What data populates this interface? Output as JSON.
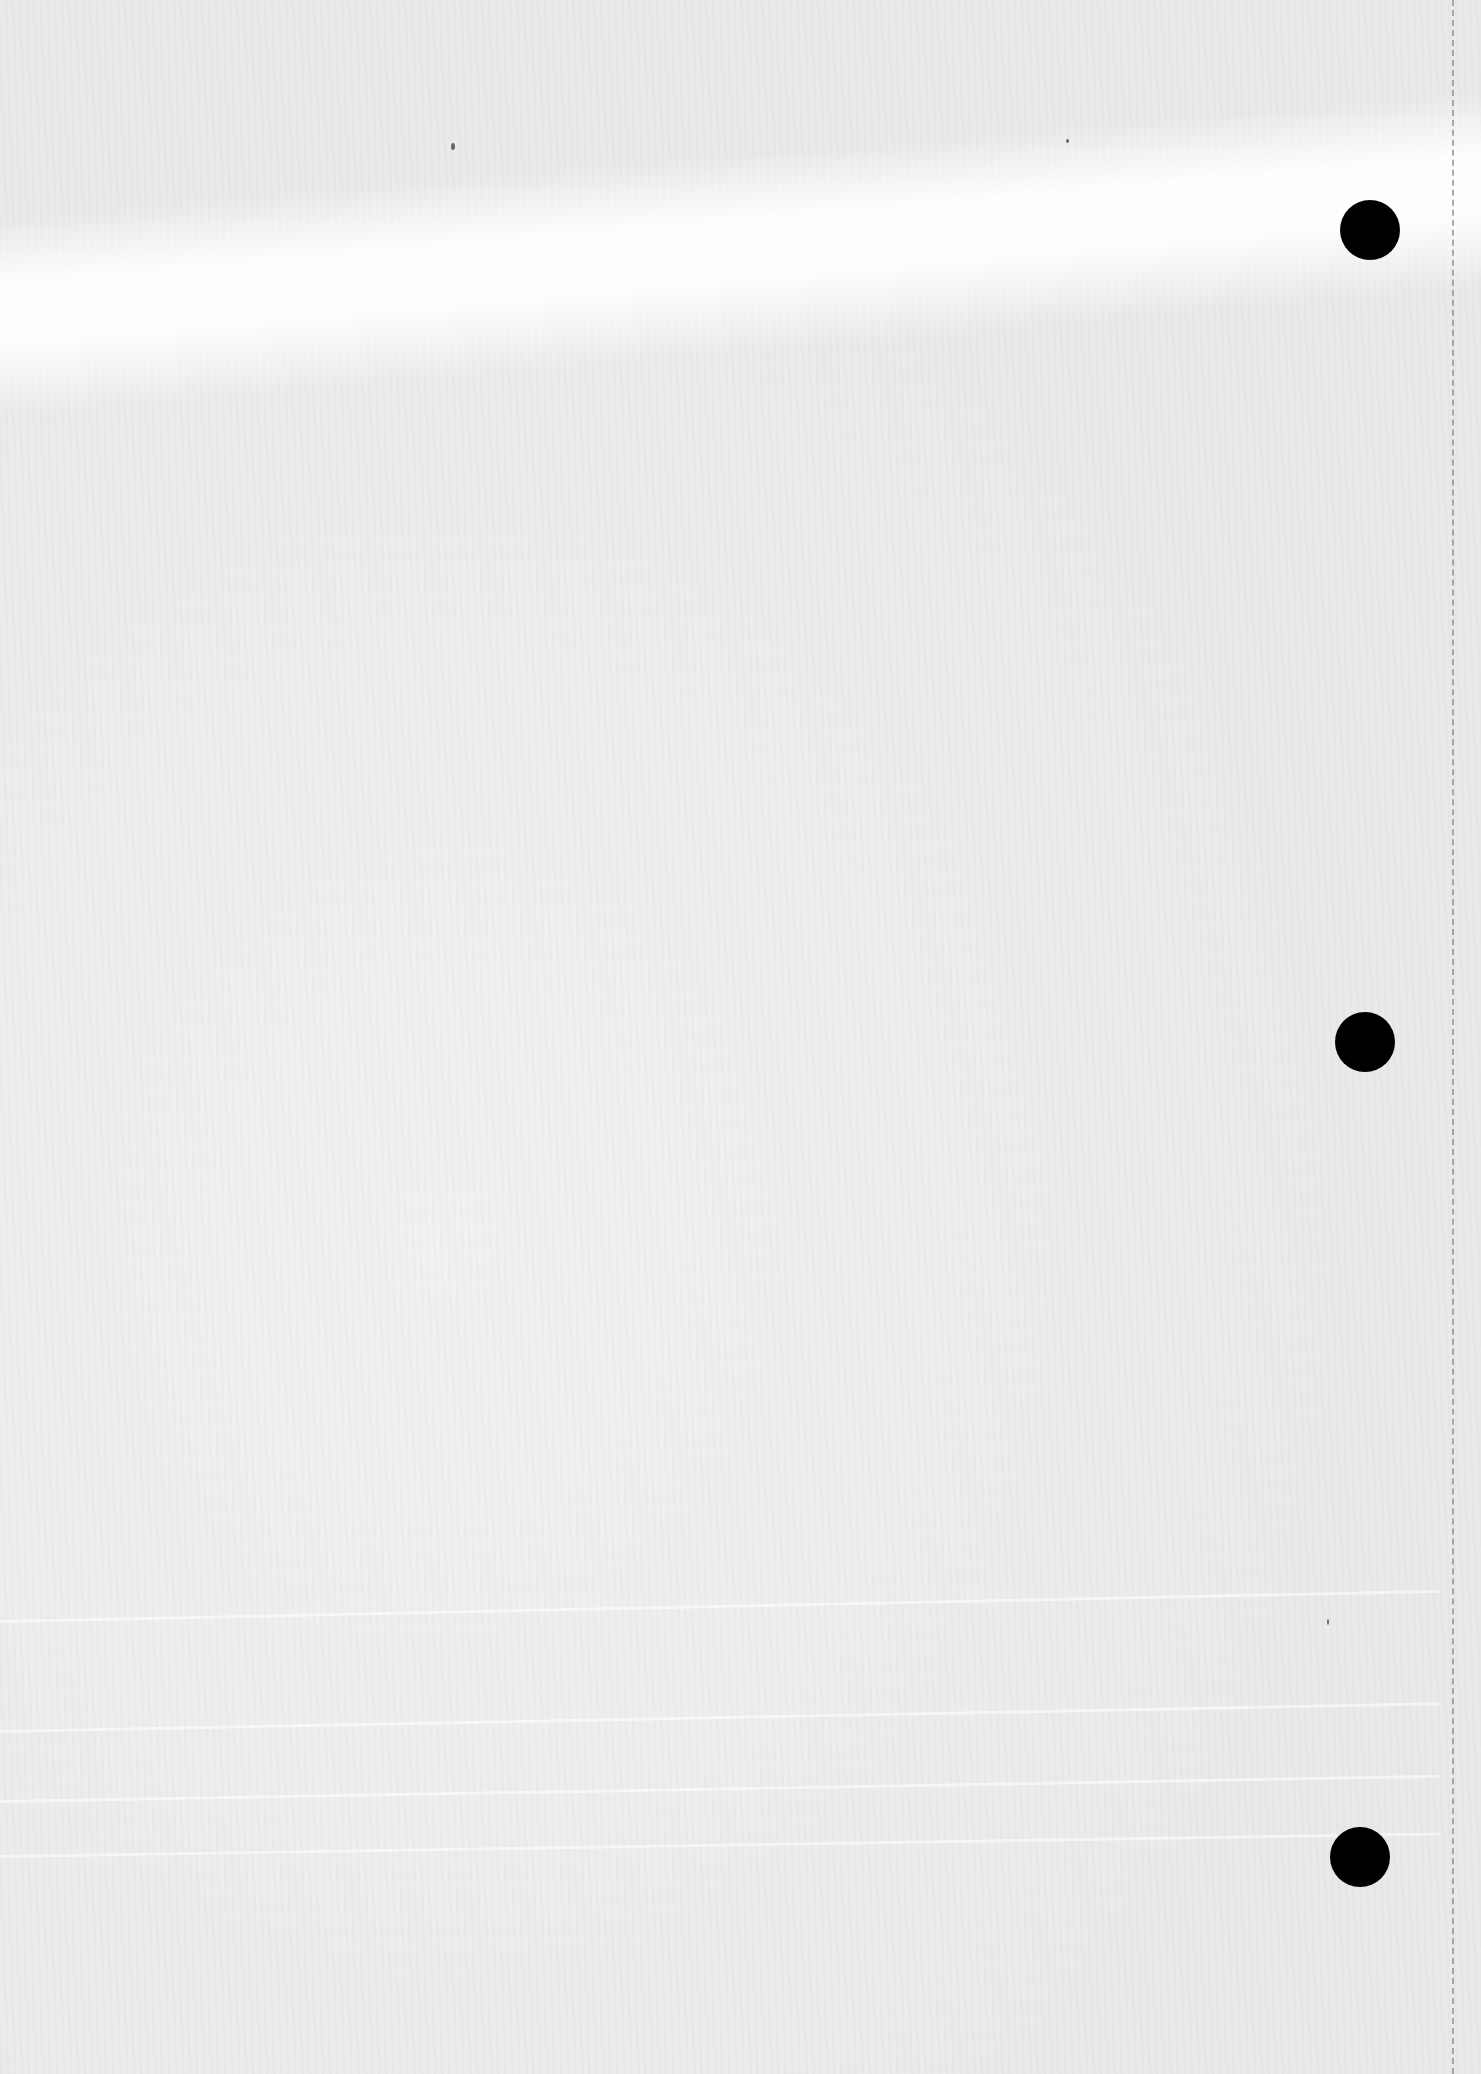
{
  "page": {
    "type": "blank scanned notebook page",
    "background_color": "#ececec",
    "punch_holes": [
      {
        "cx": 1370,
        "cy": 230,
        "r": 30
      },
      {
        "cx": 1365,
        "cy": 1042,
        "r": 30
      },
      {
        "cx": 1360,
        "cy": 1857,
        "r": 30
      }
    ],
    "perforation_x": 1452,
    "hole_color": "#000000"
  }
}
